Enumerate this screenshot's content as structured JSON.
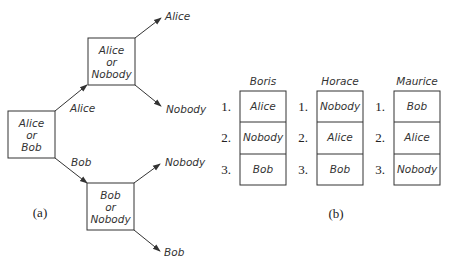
{
  "part_a": {
    "caption": "(a)",
    "root_node": {
      "lines": [
        "Alice",
        "or",
        "Bob"
      ]
    },
    "upper_node": {
      "lines": [
        "Alice",
        "or",
        "Nobody"
      ]
    },
    "lower_node": {
      "lines": [
        "Bob",
        "or",
        "Nobody"
      ]
    },
    "edge_labels": {
      "to_upper": "Alice",
      "to_lower": "Bob"
    },
    "leaves": {
      "upper_top": "Alice",
      "upper_bottom": "Nobody",
      "lower_top": "Nobody",
      "lower_bottom": "Bob"
    }
  },
  "part_b": {
    "caption": "(b)",
    "columns": [
      {
        "name": "Boris",
        "ranks": [
          "1.",
          "2.",
          "3."
        ],
        "items": [
          "Alice",
          "Nobody",
          "Bob"
        ]
      },
      {
        "name": "Horace",
        "ranks": [
          "1.",
          "2.",
          "3."
        ],
        "items": [
          "Nobody",
          "Alice",
          "Bob"
        ]
      },
      {
        "name": "Maurice",
        "ranks": [
          "1.",
          "2.",
          "3."
        ],
        "items": [
          "Bob",
          "Alice",
          "Nobody"
        ]
      }
    ]
  },
  "colors": {
    "stroke": "#333333",
    "background": "#ffffff"
  }
}
